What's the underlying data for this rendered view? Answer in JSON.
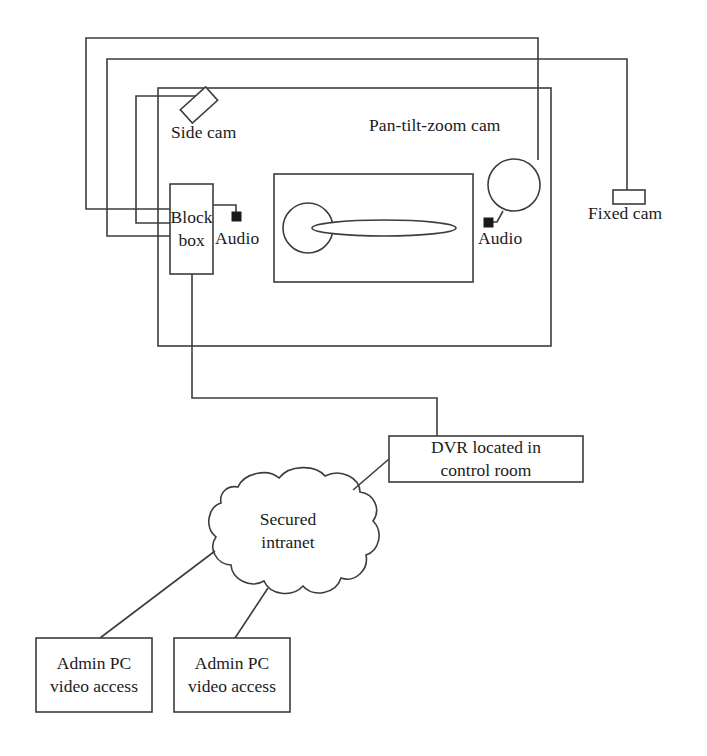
{
  "diagram": {
    "stroke_color": "#3d3d3d",
    "text_color": "#1b1b1b",
    "background_color": "#ffffff",
    "labels": {
      "side_cam": "Side cam",
      "pan_tilt_zoom_cam": "Pan-tilt-zoom cam",
      "fixed_cam": "Fixed cam",
      "block_box_line1": "Block",
      "block_box_line2": "box",
      "audio_left": "Audio",
      "audio_right": "Audio",
      "dvr_line1": "DVR located in",
      "dvr_line2": "control room",
      "cloud_line1": "Secured",
      "cloud_line2": "intranet",
      "admin_pc_left_line1": "Admin PC",
      "admin_pc_left_line2": "video access",
      "admin_pc_right_line1": "Admin PC",
      "admin_pc_right_line2": "video access"
    },
    "nodes": [
      {
        "id": "side-cam",
        "type": "camera-tilted-rect",
        "label": "Side cam"
      },
      {
        "id": "pan-tilt-zoom-cam",
        "type": "camera-circle",
        "label": "Pan-tilt-zoom cam"
      },
      {
        "id": "fixed-cam",
        "type": "camera-rect",
        "label": "Fixed cam"
      },
      {
        "id": "block-box",
        "type": "box",
        "label": "Block box"
      },
      {
        "id": "audio-left",
        "type": "audio-sensor",
        "label": "Audio"
      },
      {
        "id": "audio-right",
        "type": "audio-sensor",
        "label": "Audio"
      },
      {
        "id": "dvr",
        "type": "box",
        "label": "DVR located in control room"
      },
      {
        "id": "secured-intranet",
        "type": "cloud",
        "label": "Secured intranet"
      },
      {
        "id": "admin-pc-1",
        "type": "box",
        "label": "Admin PC video access"
      },
      {
        "id": "admin-pc-2",
        "type": "box",
        "label": "Admin PC video access"
      },
      {
        "id": "room",
        "type": "room-outline",
        "label": ""
      },
      {
        "id": "table",
        "type": "table-outline",
        "label": ""
      }
    ],
    "connections": [
      {
        "from": "block-box",
        "to": "pan-tilt-zoom-cam"
      },
      {
        "from": "block-box",
        "to": "fixed-cam"
      },
      {
        "from": "block-box",
        "to": "side-cam"
      },
      {
        "from": "block-box",
        "to": "audio-left"
      },
      {
        "from": "block-box",
        "to": "audio-right"
      },
      {
        "from": "block-box",
        "to": "dvr"
      },
      {
        "from": "dvr",
        "to": "secured-intranet"
      },
      {
        "from": "secured-intranet",
        "to": "admin-pc-1"
      },
      {
        "from": "secured-intranet",
        "to": "admin-pc-2"
      }
    ]
  }
}
